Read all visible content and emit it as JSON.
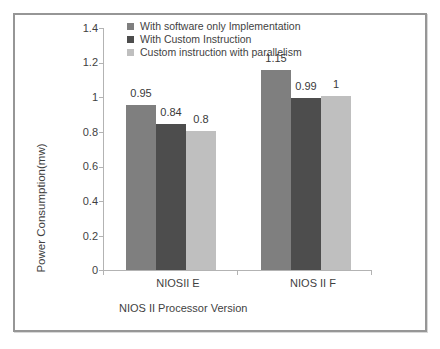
{
  "figure": {
    "background": "#ffffff",
    "frame_border_color": "#969696",
    "axis_line_color": "#b3b3b3",
    "text_color": "#3f3f3f"
  },
  "chart_data": {
    "type": "bar",
    "title": "",
    "xlabel": "NIOS II Processor Version",
    "ylabel": "Power Consumption(mw)",
    "categories": [
      "NIOSII E",
      "NIOS II F"
    ],
    "series": [
      {
        "name": "With software only Implementation",
        "color": "#7f7f7f",
        "values": [
          0.95,
          1.15
        ]
      },
      {
        "name": "With Custom Instruction",
        "color": "#4d4d4d",
        "values": [
          0.84,
          0.99
        ]
      },
      {
        "name": "Custom instruction with parallelism",
        "color": "#bfbfbf",
        "values": [
          0.8,
          1
        ]
      }
    ],
    "value_labels": [
      [
        "0.95",
        "0.84",
        "0.8"
      ],
      [
        "1.15",
        "0.99",
        "1"
      ]
    ],
    "ylim": [
      0,
      1.4
    ],
    "yticks": [
      "0",
      "0.2",
      "0.4",
      "0.6",
      "0.8",
      "1",
      "1.2",
      "1.4"
    ],
    "grid": false,
    "legend_position": "top-inside"
  }
}
